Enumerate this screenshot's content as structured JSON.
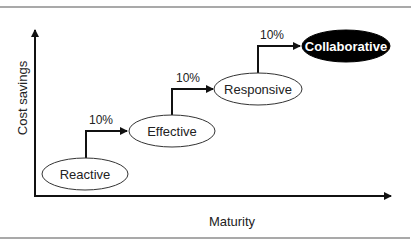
{
  "diagram": {
    "y_axis_label": "Cost savings",
    "x_axis_label": "Maturity",
    "stages": [
      {
        "label": "Reactive",
        "highlighted": false
      },
      {
        "label": "Effective",
        "highlighted": false
      },
      {
        "label": "Responsive",
        "highlighted": false
      },
      {
        "label": "Collaborative",
        "highlighted": true
      }
    ],
    "steps": [
      {
        "from": "Reactive",
        "to": "Effective",
        "label": "10%"
      },
      {
        "from": "Effective",
        "to": "Responsive",
        "label": "10%"
      },
      {
        "from": "Responsive",
        "to": "Collaborative",
        "label": "10%"
      }
    ],
    "colors": {
      "line": "#111111",
      "highlight_fill": "#000000",
      "highlight_text": "#ffffff",
      "frame_line": "#555555"
    }
  }
}
